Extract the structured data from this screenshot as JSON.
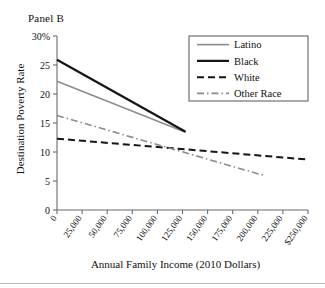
{
  "figure": {
    "panel_label": "Panel B",
    "x_axis_title": "Annual Family Income (2010 Dollars)",
    "y_axis_title": "Destination Poverty Rate"
  },
  "chart_data": {
    "type": "line",
    "title": "Panel B",
    "xlabel": "Annual Family Income (2010 Dollars)",
    "ylabel": "Destination Poverty Rate",
    "xlim": [
      0,
      250000
    ],
    "ylim": [
      0,
      30
    ],
    "grid": false,
    "legend_position": "top-right",
    "xticks": [
      0,
      25000,
      50000,
      75000,
      100000,
      125000,
      150000,
      175000,
      200000,
      225000,
      250000
    ],
    "xtick_labels": [
      "0",
      "25,000",
      "50,000",
      "75,000",
      "100,000",
      "125,000",
      "150,000",
      "175,000",
      "200,000",
      "225,000",
      "$250,000"
    ],
    "yticks": [
      0,
      5,
      10,
      15,
      20,
      25,
      30
    ],
    "ytick_labels": [
      "0",
      "5",
      "10",
      "15",
      "20",
      "25",
      "30%"
    ],
    "series": [
      {
        "name": "Latino",
        "style": "solid",
        "color": "#8c8c8c",
        "width": 1.6,
        "x": [
          0,
          128000
        ],
        "y": [
          22.2,
          13.4
        ]
      },
      {
        "name": "Black",
        "style": "solid",
        "color": "#151515",
        "width": 2.2,
        "x": [
          0,
          128000
        ],
        "y": [
          25.9,
          13.5
        ]
      },
      {
        "name": "White",
        "style": "dashed",
        "color": "#151515",
        "width": 2.0,
        "x": [
          0,
          250000
        ],
        "y": [
          12.3,
          8.7
        ]
      },
      {
        "name": "Other Race",
        "style": "dashdot",
        "color": "#8c8c8c",
        "width": 1.6,
        "x": [
          0,
          207000
        ],
        "y": [
          16.3,
          5.9
        ]
      }
    ]
  },
  "legend": {
    "items": [
      {
        "label": "Latino"
      },
      {
        "label": "Black"
      },
      {
        "label": "White"
      },
      {
        "label": "Other Race"
      }
    ]
  }
}
